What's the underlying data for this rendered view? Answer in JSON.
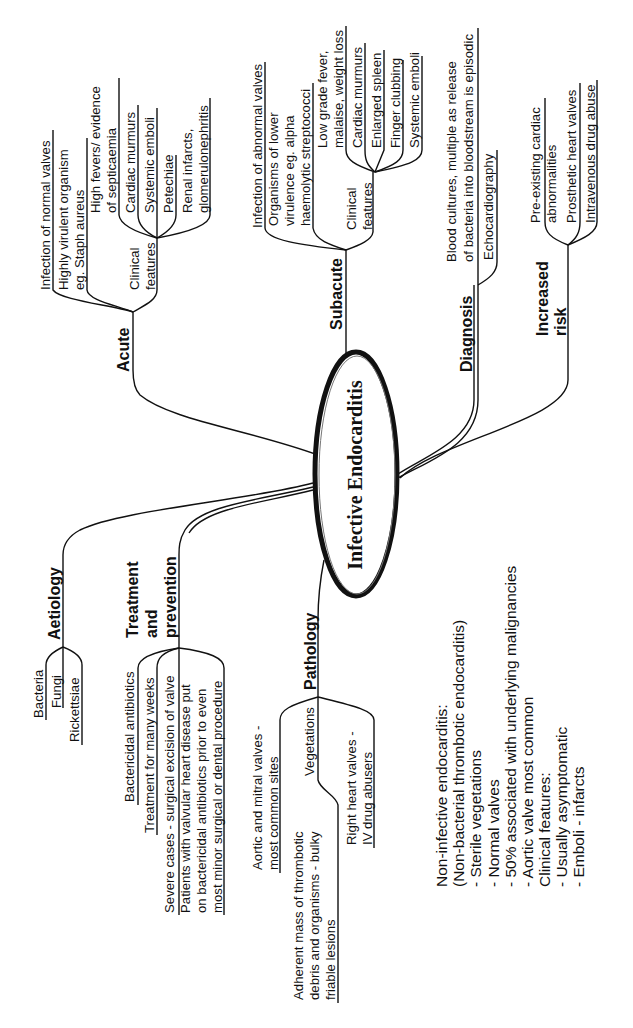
{
  "central": {
    "title": "Infective Endocarditis"
  },
  "branches": {
    "acute": {
      "label": "Acute",
      "items": [
        "Infection of normal valves",
        [
          "Highly virulent organism",
          "eg. Staph aureus"
        ]
      ],
      "clinical": {
        "label": [
          "Clinical",
          "features"
        ],
        "items": [
          [
            "High fevers/ evidence",
            "of septicaemia"
          ],
          "Cardiac murmurs",
          "Systemic emboli",
          "Petechiae",
          [
            "Renal infarcts,",
            "glomerulonephritis"
          ]
        ]
      }
    },
    "subacute": {
      "label": "Subacute",
      "items": [
        "Infection of abnormal valves",
        [
          "Organisms of lower",
          "virulence eg. alpha",
          "haemolytic streptococci"
        ]
      ],
      "clinical": {
        "label": [
          "Clinical",
          "features"
        ],
        "items": [
          [
            "Low grade fever,",
            "malaise, weight loss"
          ],
          "Cardiac murmurs",
          "Enlarged spleen",
          "Finger clubbing",
          "Systemic emboli"
        ]
      }
    },
    "diagnosis": {
      "label": "Diagnosis",
      "items": [
        [
          "Blood cultures, multiple as release",
          "of bacteria into bloodstream is episodic"
        ],
        "Echocardiography"
      ]
    },
    "increased_risk": {
      "label": [
        "Increased",
        "risk"
      ],
      "items": [
        [
          "Pre-existing cardiac",
          "abnormalities"
        ],
        "Prosthetic heart valves",
        "Intravenous drug abuse"
      ]
    },
    "aetiology": {
      "label": "Aetiology",
      "items": [
        "Bacteria",
        "Fungi",
        "Rickettsiae"
      ]
    },
    "treatment": {
      "label": [
        "Treatment",
        "and",
        "prevention"
      ],
      "items": [
        "Bactericidal antibiotics",
        "Treatment for many weeks",
        "Severe cases - surgical excision of valve",
        [
          "Patients with valvular heart disease put",
          "on bactericidal antibiotics prior to even",
          "most minor surgical or dental procedure"
        ]
      ]
    },
    "pathology": {
      "label": "Pathology",
      "items": [
        [
          "Aortic and mitral valves -",
          "most common sites"
        ],
        "Vegetations",
        [
          "Adherent mass of thrombotic",
          "debris and organisms - bulky",
          "friable lesions"
        ],
        [
          "Right heart valves -",
          "IV drug abusers"
        ]
      ]
    }
  },
  "note": {
    "lines": [
      "Non-infective endocarditis:",
      "(Non-bacterial thrombotic endocarditis)",
      "- Sterile vegetations",
      "- Normal valves",
      "- 50% associated with underlying malignancies",
      "- Aortic valve most common",
      "Clinical  features:",
      "- Usually asymptomatic",
      "- Emboli - infarcts"
    ]
  },
  "colors": {
    "ink": "#111111",
    "background": "#ffffff"
  }
}
